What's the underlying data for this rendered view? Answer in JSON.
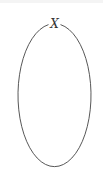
{
  "diagram": {
    "type": "ellipse-node",
    "node": {
      "label": "X",
      "shape": "ellipse",
      "center": [
        54.5,
        95.5
      ],
      "rx": 36.5,
      "ry": 71.5,
      "stroke_color": "#444444",
      "fill_color": "#ffffff"
    },
    "label_position": [
      54.5,
      27
    ]
  }
}
